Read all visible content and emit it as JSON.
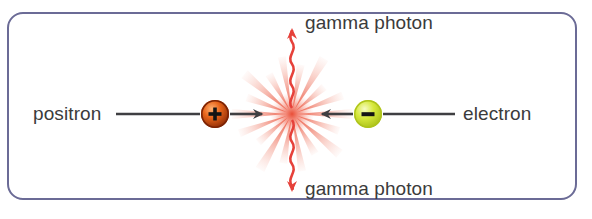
{
  "diagram": {
    "frame": {
      "border_color": "#6b6b96",
      "background": "#ffffff",
      "corner_radius": 16
    },
    "labels": {
      "positron": "positron",
      "electron": "electron",
      "gamma_top": "gamma photon",
      "gamma_bottom": "gamma photon",
      "text_color": "#3b3b3b"
    },
    "particles": [
      {
        "name": "positron",
        "charge_sign": "+",
        "fill_color": "#e8651a",
        "rim_color": "#8c2a06",
        "highlight_color": "#ffb273",
        "glyph_color": "#1a1a1a",
        "cx": 215,
        "cy": 114,
        "r": 14,
        "direction": "right"
      },
      {
        "name": "electron",
        "charge_sign": "−",
        "fill_color": "#d7e93c",
        "rim_color": "#a9bf18",
        "highlight_color": "#f2f9a8",
        "glyph_color": "#1a1a1a",
        "cx": 368,
        "cy": 114,
        "r": 14,
        "direction": "left"
      }
    ],
    "annihilation_point": {
      "x": 292,
      "y": 114,
      "burst_color": "#f0654f",
      "burst_core_color": "#e8442c",
      "spike_count": 18
    },
    "photons": [
      {
        "name": "gamma-photon-up",
        "direction": "up",
        "color": "#e6413a",
        "from_y": 108,
        "to_y": 22
      },
      {
        "name": "gamma-photon-down",
        "direction": "down",
        "color": "#e6413a",
        "from_y": 120,
        "to_y": 196
      }
    ],
    "tracks": [
      {
        "name": "positron-track",
        "color": "#3f3f42",
        "x1": 116,
        "x2": 268,
        "y": 114,
        "arrow": "right"
      },
      {
        "name": "electron-track",
        "color": "#3f3f42",
        "x1": 455,
        "x2": 316,
        "y": 114,
        "arrow": "left"
      }
    ]
  }
}
